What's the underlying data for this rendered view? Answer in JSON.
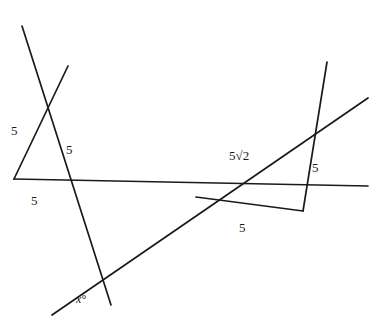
{
  "figure": {
    "width": 381,
    "height": 335,
    "background_color": "#ffffff",
    "stroke_color": "#1a1a1a"
  },
  "labels": {
    "left_triangle_left_side": "5",
    "left_triangle_right_side": "5",
    "left_triangle_base": "5",
    "right_triangle_hypotenuse": "5√2",
    "right_triangle_right_side": "5",
    "right_triangle_base": "5",
    "angle": "x°"
  },
  "label_positions": {
    "left_triangle_left_side": {
      "x": 11,
      "y": 124
    },
    "left_triangle_right_side": {
      "x": 66,
      "y": 143
    },
    "left_triangle_base": {
      "x": 31,
      "y": 194
    },
    "right_triangle_hypotenuse": {
      "x": 229,
      "y": 149
    },
    "right_triangle_right_side": {
      "x": 312,
      "y": 161
    },
    "right_triangle_base": {
      "x": 239,
      "y": 221
    },
    "angle": {
      "x": 76,
      "y": 293
    }
  },
  "segments": [
    {
      "name": "left-descending-segment",
      "x1": 22,
      "y1": 26,
      "x2": 111,
      "y2": 305
    },
    {
      "name": "left-ascending-segment",
      "x1": 68,
      "y1": 66,
      "x2": 14,
      "y2": 179
    },
    {
      "name": "long-shallow-segment",
      "x1": 14,
      "y1": 179,
      "x2": 368,
      "y2": 186
    },
    {
      "name": "long-rising-segment",
      "x1": 52,
      "y1": 315,
      "x2": 368,
      "y2": 98
    },
    {
      "name": "right-descending-segment",
      "x1": 327,
      "y1": 62,
      "x2": 303,
      "y2": 211
    },
    {
      "name": "right-base-segment",
      "x1": 303,
      "y1": 211,
      "x2": 196,
      "y2": 197
    }
  ]
}
